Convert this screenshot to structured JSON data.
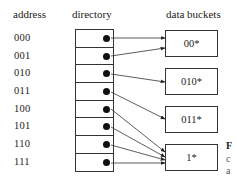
{
  "headers": {
    "address": "address",
    "directory": "directory",
    "buckets": "data buckets"
  },
  "addresses": [
    "000",
    "001",
    "010",
    "011",
    "100",
    "101",
    "110",
    "111"
  ],
  "buckets": [
    {
      "label": "00*",
      "top": 30
    },
    {
      "label": "010*",
      "top": 68
    },
    {
      "label": "011*",
      "top": 106
    },
    {
      "label": "1*",
      "top": 144
    }
  ],
  "pointers": [
    0,
    0,
    1,
    2,
    3,
    3,
    3,
    3
  ],
  "edge_text": [
    "F",
    "c",
    "a"
  ]
}
